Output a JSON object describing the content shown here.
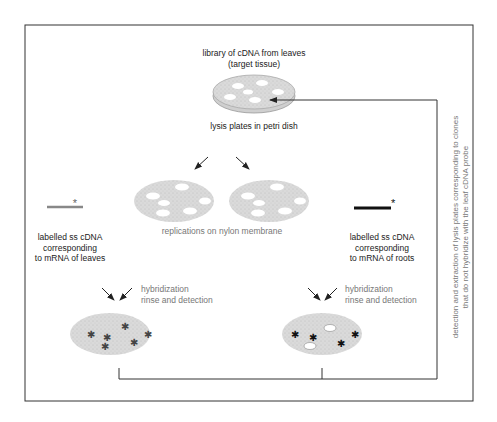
{
  "diagram": {
    "title": "",
    "top": {
      "library_label_line1": "library of cDNA from leaves",
      "library_label_line2": "(target tissue)",
      "dish_caption": "lysis plates in petri dish"
    },
    "middle": {
      "replication_caption": "replications on nylon membrane",
      "probe_left": {
        "line1": "labelled ss cDNA",
        "line2": "corresponding",
        "line3": "to mRNA of leaves",
        "marker": "*"
      },
      "probe_right": {
        "line1": "labelled ss cDNA",
        "line2": "corresponding",
        "line3": "to mRNA of roots",
        "marker": "*"
      }
    },
    "bottom": {
      "step_left_line1": "hybridization",
      "step_left_line2": "rinse and detection",
      "step_right_line1": "hybridization",
      "step_right_line2": "rinse and detection"
    },
    "side_note": {
      "line1": "detection and extraction of lysis plates corresponding to clones",
      "line2": "that do not hybridize with the leaf cDNA probe"
    },
    "colors": {
      "frame": "#333333",
      "membrane_fill": "#d8d8d8",
      "plaque_fill": "#ffffff",
      "probe_leaves": "#888888",
      "probe_roots": "#111111",
      "text_dark": "#222222",
      "text_grey": "#777777"
    }
  }
}
